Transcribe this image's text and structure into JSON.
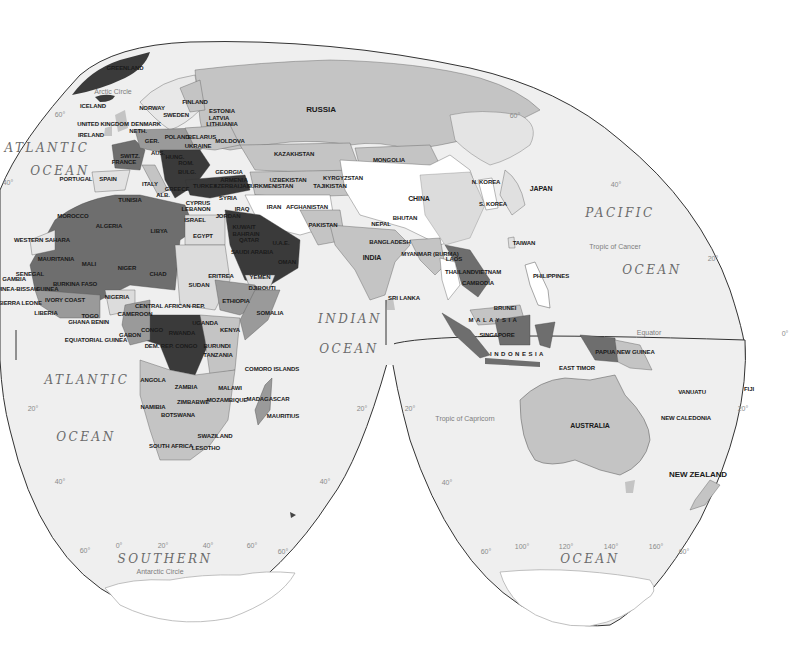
{
  "map": {
    "type": "choropleth-world-map",
    "projection_style": "interrupted",
    "colors": {
      "ocean": "#efefef",
      "outline": "#333333",
      "tier_darkest": "#3a3a3a",
      "tier_dark": "#6e6e6e",
      "tier_medium": "#9a9a9a",
      "tier_light": "#c4c4c4",
      "tier_lightest": "#dcdcdc",
      "tier_none": "#ffffff"
    },
    "oceans": [
      {
        "name": "ATLANTIC",
        "x": 47,
        "y": 148
      },
      {
        "name": "OCEAN",
        "x": 60,
        "y": 171
      },
      {
        "name": "ATLANTIC",
        "x": 87,
        "y": 380
      },
      {
        "name": "OCEAN",
        "x": 86,
        "y": 437
      },
      {
        "name": "INDIAN",
        "x": 350,
        "y": 319
      },
      {
        "name": "OCEAN",
        "x": 349,
        "y": 349
      },
      {
        "name": "PACIFIC",
        "x": 620,
        "y": 213
      },
      {
        "name": "OCEAN",
        "x": 652,
        "y": 270
      },
      {
        "name": "SOUTHERN",
        "x": 165,
        "y": 559
      },
      {
        "name": "OCEAN",
        "x": 590,
        "y": 559
      }
    ],
    "reference_lines": [
      {
        "name": "Arctic Circle",
        "x": 113,
        "y": 91
      },
      {
        "name": "Tropic of Cancer",
        "x": 615,
        "y": 246
      },
      {
        "name": "Equator",
        "x": 649,
        "y": 332
      },
      {
        "name": "Tropic of Capricorn",
        "x": 465,
        "y": 418
      },
      {
        "name": "Antarctic Circle",
        "x": 160,
        "y": 571
      }
    ],
    "graticule_labels": [
      {
        "text": "60°",
        "x": 60,
        "y": 114
      },
      {
        "text": "40°",
        "x": 8,
        "y": 182
      },
      {
        "text": "60°",
        "x": 515,
        "y": 115
      },
      {
        "text": "40°",
        "x": 616,
        "y": 184
      },
      {
        "text": "20°",
        "x": 713,
        "y": 258
      },
      {
        "text": "0°",
        "x": 785,
        "y": 333
      },
      {
        "text": "20°",
        "x": 33,
        "y": 408
      },
      {
        "text": "20°",
        "x": 362,
        "y": 408
      },
      {
        "text": "20°",
        "x": 410,
        "y": 408
      },
      {
        "text": "20°",
        "x": 743,
        "y": 408
      },
      {
        "text": "40°",
        "x": 60,
        "y": 481
      },
      {
        "text": "40°",
        "x": 325,
        "y": 481
      },
      {
        "text": "40°",
        "x": 447,
        "y": 482
      },
      {
        "text": "60°",
        "x": 85,
        "y": 550
      },
      {
        "text": "0°",
        "x": 119,
        "y": 545
      },
      {
        "text": "20°",
        "x": 163,
        "y": 545
      },
      {
        "text": "40°",
        "x": 208,
        "y": 545
      },
      {
        "text": "60°",
        "x": 252,
        "y": 545
      },
      {
        "text": "60°",
        "x": 283,
        "y": 551
      },
      {
        "text": "60°",
        "x": 486,
        "y": 551
      },
      {
        "text": "100°",
        "x": 522,
        "y": 546
      },
      {
        "text": "120°",
        "x": 566,
        "y": 546
      },
      {
        "text": "140°",
        "x": 611,
        "y": 546
      },
      {
        "text": "160°",
        "x": 656,
        "y": 546
      },
      {
        "text": "60°",
        "x": 684,
        "y": 551
      }
    ],
    "country_labels": [
      {
        "name": "GREENLAND",
        "x": 125,
        "y": 68,
        "size": ""
      },
      {
        "name": "ICELAND",
        "x": 93,
        "y": 106,
        "size": ""
      },
      {
        "name": "NORWAY",
        "x": 152,
        "y": 108,
        "size": ""
      },
      {
        "name": "SWEDEN",
        "x": 176,
        "y": 115,
        "size": ""
      },
      {
        "name": "FINLAND",
        "x": 195,
        "y": 102,
        "size": ""
      },
      {
        "name": "ESTONIA",
        "x": 222,
        "y": 111,
        "size": ""
      },
      {
        "name": "LATVIA",
        "x": 219,
        "y": 118,
        "size": ""
      },
      {
        "name": "LITHUANIA",
        "x": 222,
        "y": 124,
        "size": ""
      },
      {
        "name": "UNITED KINGDOM",
        "x": 103,
        "y": 124,
        "size": ""
      },
      {
        "name": "DENMARK",
        "x": 146,
        "y": 124,
        "size": ""
      },
      {
        "name": "NETH.",
        "x": 138,
        "y": 131,
        "size": ""
      },
      {
        "name": "IRELAND",
        "x": 91,
        "y": 135,
        "size": ""
      },
      {
        "name": "POLAND",
        "x": 177,
        "y": 137,
        "size": ""
      },
      {
        "name": "BELARUS",
        "x": 202,
        "y": 137,
        "size": ""
      },
      {
        "name": "MOLDOVA",
        "x": 230,
        "y": 141,
        "size": ""
      },
      {
        "name": "GER.",
        "x": 152,
        "y": 141,
        "size": ""
      },
      {
        "name": "UKRAINE",
        "x": 198,
        "y": 146,
        "size": ""
      },
      {
        "name": "AUS.",
        "x": 158,
        "y": 153,
        "size": ""
      },
      {
        "name": "HUNG.",
        "x": 175,
        "y": 157,
        "size": ""
      },
      {
        "name": "SWITZ.",
        "x": 130,
        "y": 156,
        "size": ""
      },
      {
        "name": "FRANCE",
        "x": 124,
        "y": 162,
        "size": ""
      },
      {
        "name": "ROM.",
        "x": 186,
        "y": 163,
        "size": ""
      },
      {
        "name": "BULG.",
        "x": 187,
        "y": 172,
        "size": ""
      },
      {
        "name": "PORTUGAL",
        "x": 76,
        "y": 179,
        "size": ""
      },
      {
        "name": "SPAIN",
        "x": 108,
        "y": 179,
        "size": ""
      },
      {
        "name": "ITALY",
        "x": 150,
        "y": 184,
        "size": ""
      },
      {
        "name": "GREECE",
        "x": 177,
        "y": 189,
        "size": ""
      },
      {
        "name": "ALB.",
        "x": 163,
        "y": 195,
        "size": ""
      },
      {
        "name": "GEORGIA",
        "x": 229,
        "y": 172,
        "size": ""
      },
      {
        "name": "ARMENIA",
        "x": 234,
        "y": 180,
        "size": ""
      },
      {
        "name": "AZERBAIJAN",
        "x": 232,
        "y": 186,
        "size": ""
      },
      {
        "name": "TURKEY",
        "x": 205,
        "y": 186,
        "size": ""
      },
      {
        "name": "CYPRUS",
        "x": 198,
        "y": 203,
        "size": ""
      },
      {
        "name": "LEBANON",
        "x": 196,
        "y": 209,
        "size": ""
      },
      {
        "name": "SYRIA",
        "x": 228,
        "y": 198,
        "size": ""
      },
      {
        "name": "ISRAEL",
        "x": 195,
        "y": 220,
        "size": ""
      },
      {
        "name": "JORDAN",
        "x": 228,
        "y": 216,
        "size": ""
      },
      {
        "name": "IRAQ",
        "x": 242,
        "y": 209,
        "size": ""
      },
      {
        "name": "KUWAIT",
        "x": 244,
        "y": 227,
        "size": ""
      },
      {
        "name": "BAHRAIN",
        "x": 246,
        "y": 234,
        "size": ""
      },
      {
        "name": "QATAR",
        "x": 249,
        "y": 240,
        "size": ""
      },
      {
        "name": "U.A.E.",
        "x": 281,
        "y": 243,
        "size": ""
      },
      {
        "name": "SAUDI ARABIA",
        "x": 252,
        "y": 252,
        "size": ""
      },
      {
        "name": "OMAN",
        "x": 287,
        "y": 262,
        "size": ""
      },
      {
        "name": "YEMEN",
        "x": 260,
        "y": 277,
        "size": ""
      },
      {
        "name": "DJIBOUTI",
        "x": 262,
        "y": 288,
        "size": ""
      },
      {
        "name": "RUSSIA",
        "x": 321,
        "y": 110,
        "size": "xl"
      },
      {
        "name": "KAZAKHSTAN",
        "x": 294,
        "y": 154,
        "size": ""
      },
      {
        "name": "MONGOLIA",
        "x": 389,
        "y": 160,
        "size": ""
      },
      {
        "name": "UZBEKISTAN",
        "x": 288,
        "y": 180,
        "size": ""
      },
      {
        "name": "KYRGYZSTAN",
        "x": 343,
        "y": 178,
        "size": ""
      },
      {
        "name": "TURKMENISTAN",
        "x": 270,
        "y": 186,
        "size": ""
      },
      {
        "name": "TAJIKISTAN",
        "x": 330,
        "y": 186,
        "size": ""
      },
      {
        "name": "IRAN",
        "x": 274,
        "y": 207,
        "size": ""
      },
      {
        "name": "AFGHANISTAN",
        "x": 307,
        "y": 207,
        "size": ""
      },
      {
        "name": "PAKISTAN",
        "x": 323,
        "y": 225,
        "size": ""
      },
      {
        "name": "CHINA",
        "x": 419,
        "y": 198,
        "size": "big"
      },
      {
        "name": "N. KOREA",
        "x": 486,
        "y": 182,
        "size": ""
      },
      {
        "name": "S. KOREA",
        "x": 493,
        "y": 204,
        "size": ""
      },
      {
        "name": "JAPAN",
        "x": 541,
        "y": 188,
        "size": "big"
      },
      {
        "name": "NEPAL",
        "x": 381,
        "y": 224,
        "size": ""
      },
      {
        "name": "BHUTAN",
        "x": 405,
        "y": 218,
        "size": ""
      },
      {
        "name": "BANGLADESH",
        "x": 390,
        "y": 242,
        "size": ""
      },
      {
        "name": "INDIA",
        "x": 372,
        "y": 257,
        "size": "big"
      },
      {
        "name": "MYANMAR (BURMA)",
        "x": 430,
        "y": 254,
        "size": ""
      },
      {
        "name": "TAIWAN",
        "x": 524,
        "y": 243,
        "size": ""
      },
      {
        "name": "LAOS",
        "x": 454,
        "y": 259,
        "size": ""
      },
      {
        "name": "THAILAND",
        "x": 460,
        "y": 272,
        "size": ""
      },
      {
        "name": "VIETNAM",
        "x": 488,
        "y": 272,
        "size": ""
      },
      {
        "name": "CAMBODIA",
        "x": 478,
        "y": 283,
        "size": ""
      },
      {
        "name": "PHILIPPINES",
        "x": 551,
        "y": 276,
        "size": ""
      },
      {
        "name": "SRI LANKA",
        "x": 404,
        "y": 298,
        "size": ""
      },
      {
        "name": "BRUNEI",
        "x": 505,
        "y": 308,
        "size": ""
      },
      {
        "name": "MALAYSIA",
        "x": 494,
        "y": 320,
        "size": "wide"
      },
      {
        "name": "SINGAPORE",
        "x": 497,
        "y": 335,
        "size": ""
      },
      {
        "name": "INDONESIA",
        "x": 518,
        "y": 354,
        "size": "wide"
      },
      {
        "name": "PAPUA NEW GUINEA",
        "x": 625,
        "y": 352,
        "size": ""
      },
      {
        "name": "EAST TIMOR",
        "x": 577,
        "y": 368,
        "size": ""
      },
      {
        "name": "VANUATU",
        "x": 692,
        "y": 392,
        "size": ""
      },
      {
        "name": "FIJI",
        "x": 749,
        "y": 389,
        "size": ""
      },
      {
        "name": "NEW CALEDONIA",
        "x": 686,
        "y": 418,
        "size": ""
      },
      {
        "name": "AUSTRALIA",
        "x": 590,
        "y": 425,
        "size": "big"
      },
      {
        "name": "NEW ZEALAND",
        "x": 698,
        "y": 475,
        "size": "xl"
      },
      {
        "name": "TUNISIA",
        "x": 130,
        "y": 200,
        "size": ""
      },
      {
        "name": "MOROCCO",
        "x": 73,
        "y": 216,
        "size": ""
      },
      {
        "name": "ALGERIA",
        "x": 109,
        "y": 226,
        "size": ""
      },
      {
        "name": "LIBYA",
        "x": 159,
        "y": 231,
        "size": ""
      },
      {
        "name": "EGYPT",
        "x": 203,
        "y": 236,
        "size": ""
      },
      {
        "name": "WESTERN SAHARA",
        "x": 42,
        "y": 240,
        "size": ""
      },
      {
        "name": "MAURITANIA",
        "x": 56,
        "y": 259,
        "size": ""
      },
      {
        "name": "MALI",
        "x": 89,
        "y": 264,
        "size": ""
      },
      {
        "name": "NIGER",
        "x": 127,
        "y": 268,
        "size": ""
      },
      {
        "name": "CHAD",
        "x": 158,
        "y": 274,
        "size": ""
      },
      {
        "name": "SUDAN",
        "x": 199,
        "y": 285,
        "size": ""
      },
      {
        "name": "ERITREA",
        "x": 221,
        "y": 276,
        "size": ""
      },
      {
        "name": "ETHIOPIA",
        "x": 236,
        "y": 301,
        "size": ""
      },
      {
        "name": "SOMALIA",
        "x": 270,
        "y": 313,
        "size": ""
      },
      {
        "name": "SENEGAL",
        "x": 30,
        "y": 274,
        "size": ""
      },
      {
        "name": "GAMBIA",
        "x": 14,
        "y": 279,
        "size": ""
      },
      {
        "name": "GUINEA-BISSAU",
        "x": 15,
        "y": 289,
        "size": ""
      },
      {
        "name": "GUINEA",
        "x": 47,
        "y": 289,
        "size": ""
      },
      {
        "name": "BURKINA FASO",
        "x": 75,
        "y": 284,
        "size": ""
      },
      {
        "name": "SIERRA LEONE",
        "x": 20,
        "y": 303,
        "size": ""
      },
      {
        "name": "IVORY COAST",
        "x": 65,
        "y": 300,
        "size": ""
      },
      {
        "name": "NIGERIA",
        "x": 117,
        "y": 297,
        "size": ""
      },
      {
        "name": "CENTRAL AFRICAN REP.",
        "x": 170,
        "y": 306,
        "size": ""
      },
      {
        "name": "LIBERIA",
        "x": 46,
        "y": 313,
        "size": ""
      },
      {
        "name": "TOGO",
        "x": 90,
        "y": 316,
        "size": ""
      },
      {
        "name": "GHANA",
        "x": 79,
        "y": 322,
        "size": ""
      },
      {
        "name": "BENIN",
        "x": 100,
        "y": 322,
        "size": ""
      },
      {
        "name": "CAMEROON",
        "x": 135,
        "y": 314,
        "size": ""
      },
      {
        "name": "UGANDA",
        "x": 205,
        "y": 323,
        "size": ""
      },
      {
        "name": "KENYA",
        "x": 230,
        "y": 330,
        "size": ""
      },
      {
        "name": "CONGO",
        "x": 152,
        "y": 330,
        "size": ""
      },
      {
        "name": "RWANDA",
        "x": 182,
        "y": 333,
        "size": ""
      },
      {
        "name": "GABON",
        "x": 130,
        "y": 335,
        "size": ""
      },
      {
        "name": "EQUATORIAL GUINEA",
        "x": 96,
        "y": 340,
        "size": ""
      },
      {
        "name": "DEM. REP. CONGO",
        "x": 171,
        "y": 346,
        "size": ""
      },
      {
        "name": "BURUNDI",
        "x": 217,
        "y": 346,
        "size": ""
      },
      {
        "name": "TANZANIA",
        "x": 218,
        "y": 355,
        "size": ""
      },
      {
        "name": "COMORO ISLANDS",
        "x": 272,
        "y": 369,
        "size": ""
      },
      {
        "name": "ANGOLA",
        "x": 153,
        "y": 380,
        "size": ""
      },
      {
        "name": "ZAMBIA",
        "x": 186,
        "y": 387,
        "size": ""
      },
      {
        "name": "MALAWI",
        "x": 230,
        "y": 388,
        "size": ""
      },
      {
        "name": "ZIMBABWE",
        "x": 193,
        "y": 402,
        "size": ""
      },
      {
        "name": "MOZAMBIQUE",
        "x": 227,
        "y": 400,
        "size": ""
      },
      {
        "name": "MADAGASCAR",
        "x": 268,
        "y": 399,
        "size": ""
      },
      {
        "name": "NAMIBIA",
        "x": 153,
        "y": 407,
        "size": ""
      },
      {
        "name": "MAURITIUS",
        "x": 283,
        "y": 416,
        "size": ""
      },
      {
        "name": "BOTSWANA",
        "x": 178,
        "y": 415,
        "size": ""
      },
      {
        "name": "SWAZILAND",
        "x": 215,
        "y": 436,
        "size": ""
      },
      {
        "name": "SOUTH AFRICA",
        "x": 171,
        "y": 446,
        "size": ""
      },
      {
        "name": "LESOTHO",
        "x": 206,
        "y": 448,
        "size": ""
      }
    ]
  }
}
